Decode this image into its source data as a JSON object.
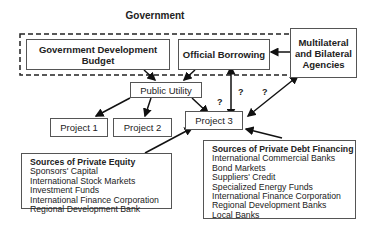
{
  "diagram": {
    "government_label": "Government",
    "gov_dev_budget": "Government Development Budget",
    "official_borrowing": "Official Borrowing",
    "multilateral": "Multilateral and Bilateral Agencies",
    "public_utility": "Public Utility",
    "project1": "Project 1",
    "project2": "Project 2",
    "project3": "Project 3",
    "question_marks": [
      "?",
      "?",
      "?"
    ],
    "equity": {
      "heading": "Sources of Private Equity",
      "items": [
        "Sponsors' Capital",
        "International Stock Markets",
        "Investment Funds",
        "International Finance Corporation",
        "Regional Development Bank"
      ]
    },
    "debt": {
      "heading": "Sources of Private Debt Financing",
      "items": [
        "International Commercial Banks",
        "Bond Markets",
        "Suppliers' Credit",
        "Specialized Energy Funds",
        "International Finance Corporation",
        "Regional Development Banks",
        "Local Banks"
      ]
    }
  }
}
